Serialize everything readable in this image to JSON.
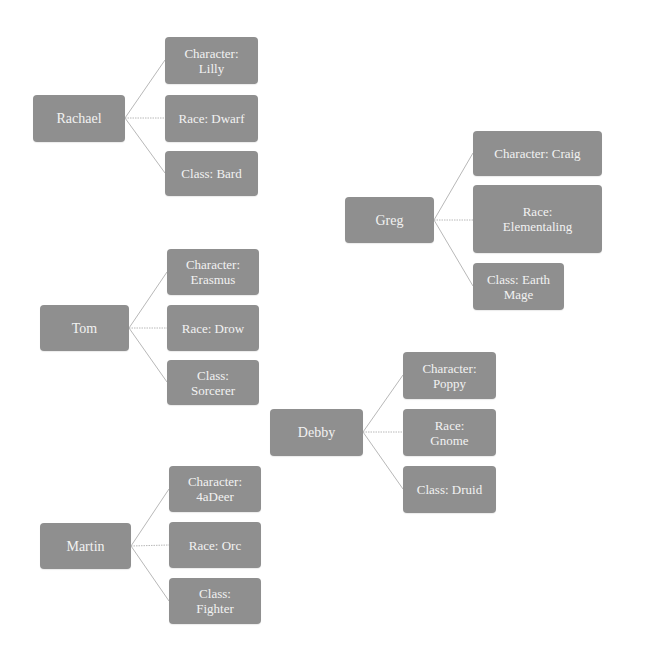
{
  "diagram": {
    "type": "hierarchy",
    "colors": {
      "box": "#8f8f8f",
      "text": "#f2f2f2",
      "connector": "#b8b8b8",
      "background": "#ffffff"
    },
    "groups": [
      {
        "player": "Rachael",
        "children": [
          {
            "label": "Character: Lilly"
          },
          {
            "label": "Race: Dwarf"
          },
          {
            "label": "Class: Bard"
          }
        ]
      },
      {
        "player": "Greg",
        "children": [
          {
            "label": "Character: Craig"
          },
          {
            "label": "Race: Elementaling"
          },
          {
            "label": "Class: Earth Mage"
          }
        ]
      },
      {
        "player": "Tom",
        "children": [
          {
            "label": "Character: Erasmus"
          },
          {
            "label": "Race: Drow"
          },
          {
            "label": "Class: Sorcerer"
          }
        ]
      },
      {
        "player": "Debby",
        "children": [
          {
            "label": "Character: Poppy"
          },
          {
            "label": "Race: Gnome"
          },
          {
            "label": "Class: Druid"
          }
        ]
      },
      {
        "player": "Martin",
        "children": [
          {
            "label": "Character: 4aDeer"
          },
          {
            "label": "Race: Orc"
          },
          {
            "label": "Class: Fighter"
          }
        ]
      }
    ]
  }
}
